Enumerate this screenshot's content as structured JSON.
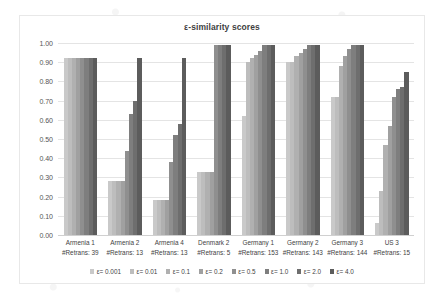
{
  "chart_data": {
    "type": "bar",
    "title": "ε-similarity scores",
    "xlabel": "",
    "ylabel": "",
    "ylim": [
      0,
      1.0
    ],
    "ytick_labels": [
      "1.00",
      "0.90",
      "0.80",
      "0.70",
      "0.60",
      "0.50",
      "0.40",
      "0.30",
      "0.20",
      "0.10",
      "0.00"
    ],
    "ytick_values": [
      1.0,
      0.9,
      0.8,
      0.7,
      0.6,
      0.5,
      0.4,
      0.3,
      0.2,
      0.1,
      0.0
    ],
    "grid": true,
    "legend_position": "bottom",
    "categories": [
      "Armenia 1",
      "Armenia 2",
      "Armenia 4",
      "Denmark 2",
      "Germany 1",
      "Germany 2",
      "Germany 3",
      "US 3"
    ],
    "category_sublabels": [
      "#Retrans: 39",
      "#Retrans: 13",
      "#Retrans: 13",
      "#Retrans: 5",
      "#Retrans: 153",
      "#Retrans: 143",
      "#Retrans: 144",
      "#Retrans: 15"
    ],
    "retrans_counts": [
      39,
      13,
      13,
      5,
      153,
      143,
      144,
      15
    ],
    "series": [
      {
        "name": "ε= 0.001",
        "color": "#c9c9c9",
        "values": [
          0.92,
          0.28,
          0.18,
          0.33,
          0.62,
          0.9,
          0.72,
          0.06
        ]
      },
      {
        "name": "ε= 0.01",
        "color": "#bdbdbd",
        "values": [
          0.92,
          0.28,
          0.18,
          0.33,
          0.9,
          0.9,
          0.72,
          0.23
        ]
      },
      {
        "name": "ε= 0.1",
        "color": "#b0b0b0",
        "values": [
          0.92,
          0.28,
          0.18,
          0.33,
          0.92,
          0.93,
          0.88,
          0.47
        ]
      },
      {
        "name": "ε= 0.2",
        "color": "#a0a0a0",
        "values": [
          0.92,
          0.28,
          0.18,
          0.33,
          0.94,
          0.95,
          0.93,
          0.57
        ]
      },
      {
        "name": "ε= 0.5",
        "color": "#8f8f8f",
        "values": [
          0.92,
          0.44,
          0.38,
          0.99,
          0.96,
          0.97,
          0.97,
          0.72
        ]
      },
      {
        "name": "ε= 1.0",
        "color": "#7e7e7e",
        "values": [
          0.92,
          0.63,
          0.52,
          0.99,
          0.99,
          0.99,
          0.99,
          0.76
        ]
      },
      {
        "name": "ε= 2.0",
        "color": "#6e6e6e",
        "values": [
          0.92,
          0.7,
          0.58,
          0.99,
          0.99,
          0.99,
          0.99,
          0.77
        ]
      },
      {
        "name": "ε= 4.0",
        "color": "#5c5c5c",
        "values": [
          0.92,
          0.92,
          0.92,
          0.99,
          0.99,
          0.99,
          0.99,
          0.85
        ]
      }
    ]
  }
}
